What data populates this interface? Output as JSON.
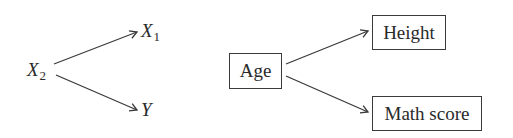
{
  "diagrams": [
    {
      "id": "abstract",
      "nodes": {
        "x2": {
          "base": "X",
          "sub": "2"
        },
        "x1": {
          "base": "X",
          "sub": "1"
        },
        "y": {
          "base": "Y"
        }
      },
      "edges": [
        {
          "from": "X2",
          "to": "X1"
        },
        {
          "from": "X2",
          "to": "Y"
        }
      ]
    },
    {
      "id": "concrete",
      "nodes": {
        "age": {
          "label": "Age"
        },
        "height": {
          "label": "Height"
        },
        "math": {
          "label": "Math score"
        }
      },
      "edges": [
        {
          "from": "Age",
          "to": "Height"
        },
        {
          "from": "Age",
          "to": "Math score"
        }
      ]
    }
  ],
  "colors": {
    "stroke": "#3a3a3a",
    "text": "#2a2a2a",
    "background": "#ffffff"
  }
}
